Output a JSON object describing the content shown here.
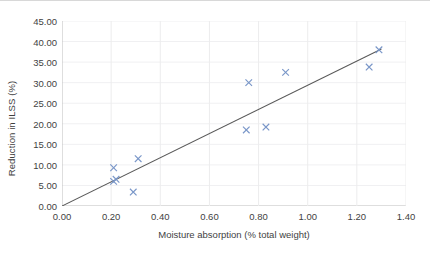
{
  "chart_data": {
    "type": "scatter",
    "title": "",
    "xlabel": "Moisture absorption (% total weight)",
    "ylabel": "Reduction in ILSS (%)",
    "xlim": [
      0.0,
      1.4
    ],
    "ylim": [
      0.0,
      45.0
    ],
    "xticks": [
      "0.00",
      "0.20",
      "0.40",
      "0.60",
      "0.80",
      "1.00",
      "1.20",
      "1.40"
    ],
    "xtick_values": [
      0.0,
      0.2,
      0.4,
      0.6,
      0.8,
      1.0,
      1.2,
      1.4
    ],
    "yticks": [
      "0.00",
      "5.00",
      "10.00",
      "15.00",
      "20.00",
      "25.00",
      "30.00",
      "35.00",
      "40.00",
      "45.00"
    ],
    "ytick_values": [
      0,
      5,
      10,
      15,
      20,
      25,
      30,
      35,
      40,
      45
    ],
    "grid": true,
    "legend": false,
    "marker_style": "x",
    "marker_color": "#7996c8",
    "trendline_color": "#595959",
    "series": [
      {
        "name": "Reduction in ILSS",
        "points": [
          {
            "x": 0.21,
            "y": 9.3
          },
          {
            "x": 0.21,
            "y": 6.0
          },
          {
            "x": 0.22,
            "y": 6.5
          },
          {
            "x": 0.29,
            "y": 3.4
          },
          {
            "x": 0.31,
            "y": 11.5
          },
          {
            "x": 0.75,
            "y": 18.5
          },
          {
            "x": 0.76,
            "y": 30.0
          },
          {
            "x": 0.83,
            "y": 19.2
          },
          {
            "x": 0.91,
            "y": 32.5
          },
          {
            "x": 1.25,
            "y": 33.8
          },
          {
            "x": 1.29,
            "y": 38.0
          }
        ]
      }
    ],
    "trendline": {
      "name": "linear fit",
      "x0": 0.0,
      "y0": 0.0,
      "x1": 1.3,
      "y1": 38.2
    }
  }
}
